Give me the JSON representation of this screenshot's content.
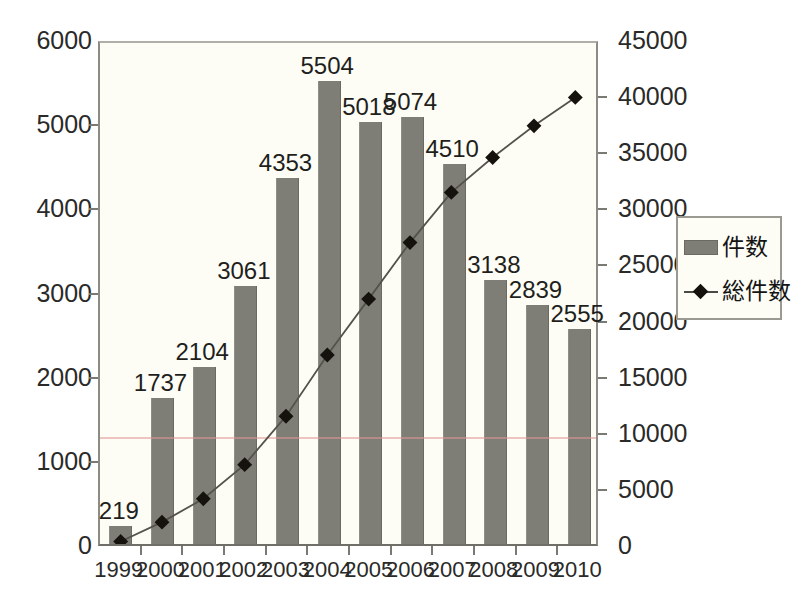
{
  "chart_data": {
    "type": "bar",
    "title": "",
    "xlabel": "",
    "ylabel": "",
    "grid": false,
    "legend_position": "right",
    "categories": [
      "1999",
      "2000",
      "2001",
      "2002",
      "2003",
      "2004",
      "2005",
      "2006",
      "2007",
      "2008",
      "2009",
      "2010"
    ],
    "series": [
      {
        "name": "件数",
        "type": "bar",
        "axis": "left",
        "values": [
          219,
          1737,
          2104,
          3061,
          4353,
          5504,
          5018,
          5074,
          4510,
          3138,
          2839,
          2555
        ],
        "color": "#7e7e76"
      },
      {
        "name": "総件数",
        "type": "line",
        "axis": "right",
        "values": [
          219,
          1956,
          4060,
          7121,
          11474,
          16978,
          21996,
          27070,
          31580,
          34718,
          37557,
          40112
        ],
        "color": "#15120d"
      }
    ],
    "left_axis": {
      "ylim": [
        0,
        6000
      ],
      "ticks": [
        0,
        1000,
        2000,
        3000,
        4000,
        5000,
        6000
      ],
      "tick_labels": [
        "0",
        "1000",
        "2000",
        "3000",
        "4000",
        "5000",
        "6000"
      ]
    },
    "right_axis": {
      "ylim": [
        0,
        45000
      ],
      "ticks": [
        0,
        5000,
        10000,
        15000,
        20000,
        25000,
        30000,
        35000,
        40000,
        45000
      ],
      "tick_labels": [
        "0",
        "5000",
        "10000",
        "15000",
        "20000",
        "25000",
        "30000",
        "35000",
        "40000",
        "45000"
      ]
    },
    "bar_value_labels": [
      "219",
      "1737",
      "2104",
      "3061",
      "4353",
      "5504",
      "5018",
      "5074",
      "4510",
      "3138",
      "2839",
      "2555"
    ]
  },
  "legend": {
    "items": [
      {
        "label": "件数",
        "marker": "bar-swatch"
      },
      {
        "label": "総件数",
        "marker": "line-diamond-swatch"
      }
    ]
  }
}
